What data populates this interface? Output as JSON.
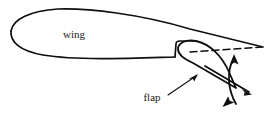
{
  "figure": {
    "background_color": "#ffffff",
    "line_color": "#100f0f",
    "labels": {
      "wing": "wing",
      "flap": "flap"
    },
    "label_positions": {
      "wing": {
        "x": 74,
        "y": 38
      },
      "flap": {
        "x": 152,
        "y": 101
      }
    },
    "geometry": {
      "airfoil_upper": "M 11,31 C 13,19 30,11 58,9 C 88,8 140,14 190,29 L 263,47",
      "airfoil_lower": "M 11,31 C 10,42 20,51 43,55 C 80,61 140,58 175,57",
      "cove_notch": "M 175,57 L 176,44 C 176,42 178,41 180,41 L 196,41",
      "flap_body": "M 196,41 C 186,39 178,43 178,49 C 178,54 184,59 193,63 L 236,88 L 229,72 C 222,56 210,44 196,41 Z",
      "flap_retracted_dashed": "M 190,52 L 262,47",
      "rotation_arc": "M 236,104 C 228,90 226,72 234,57",
      "flap_chord_line": "M 205,66 L 249,92",
      "leader_line": "M 168,95 L 196,76"
    },
    "arrows": [
      {
        "name": "rotation-arrow-up",
        "tip": {
          "x": 234,
          "y": 56
        }
      },
      {
        "name": "rotation-arrow-down",
        "tip": {
          "x": 224,
          "y": 105
        }
      },
      {
        "name": "flap-chord-arrow",
        "tip": {
          "x": 250,
          "y": 93
        }
      },
      {
        "name": "leader-arrow",
        "tip": {
          "x": 197,
          "y": 75
        }
      }
    ]
  }
}
